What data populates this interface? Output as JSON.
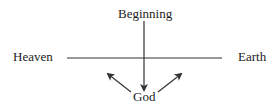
{
  "diagram": {
    "labels": {
      "top": "Beginning",
      "left": "Heaven",
      "right": "Earth",
      "bottom": "God"
    },
    "lines": [
      {
        "name": "heaven-earth-line",
        "type": "line"
      },
      {
        "name": "beginning-to-god-arrow",
        "type": "arrow",
        "direction": "down"
      },
      {
        "name": "god-to-heaven-arrow",
        "type": "arrow",
        "direction": "up-left"
      },
      {
        "name": "god-to-earth-arrow",
        "type": "arrow",
        "direction": "up-right"
      }
    ],
    "colors": {
      "stroke": "#333333",
      "text": "#222222",
      "background": "#ffffff"
    }
  }
}
